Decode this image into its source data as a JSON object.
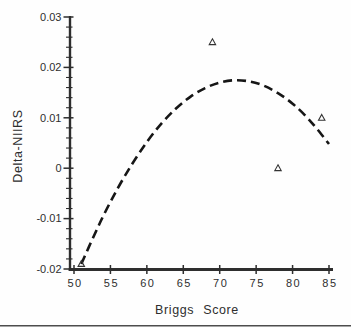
{
  "chart_data": {
    "type": "scatter",
    "title": "",
    "xlabel": "Briggs Score",
    "ylabel": "Delta-NIIRS",
    "xlim": [
      50,
      85
    ],
    "ylim": [
      -0.02,
      0.03
    ],
    "grid": false,
    "legend": false,
    "x_ticks": [
      50,
      55,
      60,
      65,
      70,
      75,
      80,
      85
    ],
    "x_tick_labels": [
      "50",
      "55",
      "60",
      "65",
      "70",
      "75",
      "80",
      "85"
    ],
    "y_ticks": [
      0.03,
      0.02,
      0.01,
      0,
      -0.01,
      -0.02
    ],
    "y_tick_labels": [
      "0.03",
      "0.02",
      "0.01",
      "0",
      "-0.01",
      "-0.02"
    ],
    "y_minor_tick_step": 0.002,
    "points": {
      "marker": "open-triangle",
      "data": [
        [
          51,
          -0.019
        ],
        [
          69,
          0.025
        ],
        [
          78,
          0.0
        ],
        [
          84,
          0.01
        ]
      ]
    },
    "fit_curve": {
      "style": "dashed",
      "shape": "quadratic",
      "peak": [
        72,
        0.0175
      ],
      "points": [
        [
          51,
          -0.019
        ],
        [
          53,
          -0.0125
        ],
        [
          55,
          -0.0066
        ],
        [
          57,
          -0.0014
        ],
        [
          59,
          0.0032
        ],
        [
          61,
          0.0072
        ],
        [
          63,
          0.0105
        ],
        [
          65,
          0.0132
        ],
        [
          67,
          0.0152
        ],
        [
          69,
          0.0166
        ],
        [
          71,
          0.0174
        ],
        [
          73,
          0.0175
        ],
        [
          75,
          0.017
        ],
        [
          77,
          0.0158
        ],
        [
          79,
          0.014
        ],
        [
          81,
          0.0116
        ],
        [
          83,
          0.0085
        ],
        [
          85,
          0.0048
        ]
      ]
    },
    "colors": {
      "background": "#fefefe",
      "axis": "#2e2e2e",
      "curve": "#161616",
      "marker": "#333333",
      "text": "#2e2e2e",
      "bottom_rule": "#4d4d4d"
    }
  }
}
